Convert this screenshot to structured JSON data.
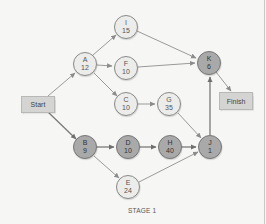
{
  "diagram": {
    "type": "activity-network",
    "caption": "STAGE 1",
    "start_label": "Start",
    "finish_label": "Finish",
    "colors": {
      "light_node": "#ececea",
      "dark_node": "#a9a9a9",
      "box": "#d4d4d2",
      "edge": "#8c8c8c"
    },
    "nodes": {
      "A": {
        "id": "A",
        "duration": "12",
        "critical": false
      },
      "I": {
        "id": "I",
        "duration": "15",
        "critical": false
      },
      "F": {
        "id": "F",
        "duration": "10",
        "critical": false
      },
      "C": {
        "id": "C",
        "duration": "10",
        "critical": false
      },
      "G": {
        "id": "G",
        "duration": "35",
        "critical": false
      },
      "K": {
        "id": "K",
        "duration": "6",
        "critical": true
      },
      "B": {
        "id": "B",
        "duration": "9",
        "critical": true
      },
      "D": {
        "id": "D",
        "duration": "10",
        "critical": true
      },
      "H": {
        "id": "H",
        "duration": "40",
        "critical": true
      },
      "J": {
        "id": "J",
        "duration": "1",
        "critical": true
      },
      "E": {
        "id": "E",
        "duration": "24",
        "critical": false
      }
    },
    "edges": [
      [
        "Start",
        "A"
      ],
      [
        "Start",
        "B"
      ],
      [
        "A",
        "I"
      ],
      [
        "A",
        "F"
      ],
      [
        "A",
        "C"
      ],
      [
        "I",
        "K"
      ],
      [
        "F",
        "K"
      ],
      [
        "C",
        "G"
      ],
      [
        "G",
        "J"
      ],
      [
        "B",
        "D"
      ],
      [
        "B",
        "E"
      ],
      [
        "D",
        "H"
      ],
      [
        "H",
        "J"
      ],
      [
        "E",
        "J"
      ],
      [
        "J",
        "K"
      ],
      [
        "K",
        "Finish"
      ]
    ]
  }
}
